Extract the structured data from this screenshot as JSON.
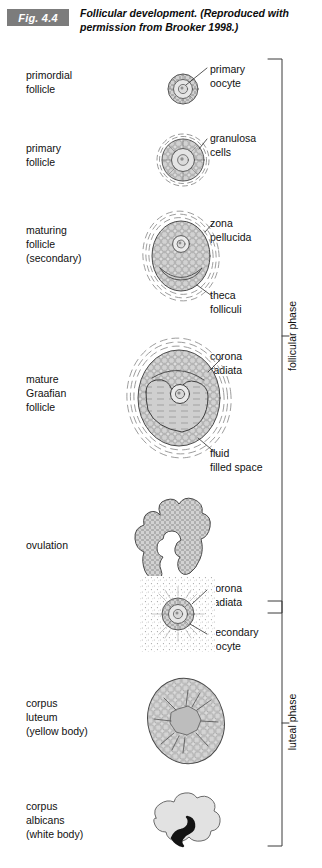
{
  "figure": {
    "badge": "Fig. 4.4",
    "caption": "Follicular development. (Reproduced with permission from Brooker 1998.)"
  },
  "stages": [
    {
      "id": "primordial-follicle",
      "label": "primordial\nfollicle"
    },
    {
      "id": "primary-follicle",
      "label": "primary\nfollicle"
    },
    {
      "id": "maturing-follicle",
      "label": "maturing\nfollicle\n(secondary)"
    },
    {
      "id": "mature-graafian-follicle",
      "label": "mature\nGraafian\nfollicle"
    },
    {
      "id": "ovulation",
      "label": "ovulation"
    },
    {
      "id": "corpus-luteum",
      "label": "corpus\nluteum\n(yellow body)"
    },
    {
      "id": "corpus-albicans",
      "label": "corpus\nalbicans\n(white body)"
    }
  ],
  "callouts": [
    {
      "id": "primary-oocyte",
      "label": "primary\noocyte"
    },
    {
      "id": "granulosa-cells",
      "label": "granulosa\ncells"
    },
    {
      "id": "zona-pellucida",
      "label": "zona\npellucida"
    },
    {
      "id": "theca-folliculi",
      "label": "theca\nfolliculi"
    },
    {
      "id": "corona-radiata-graafian",
      "label": "corona\nradiata"
    },
    {
      "id": "fluid-filled-space",
      "label": "fluid\nfilled space"
    },
    {
      "id": "corona-radiata-oocyte",
      "label": "corona\nradiata"
    },
    {
      "id": "secondary-oocyte",
      "label": "secondary\noocyte"
    }
  ],
  "phases": [
    {
      "id": "follicular-phase",
      "label": "follicular phase"
    },
    {
      "id": "luteal-phase",
      "label": "luteal phase"
    }
  ],
  "colors": {
    "badge_background": "#7c7c7c",
    "badge_text": "#ffffff",
    "ink": "#111111",
    "line": "#3a3a3a",
    "cell_fill": "#d9d9d9",
    "light_fill": "#e8e8e8",
    "fluid_fill": "#cfcfcf",
    "scar": "#121212",
    "page_background": "#ffffff"
  }
}
